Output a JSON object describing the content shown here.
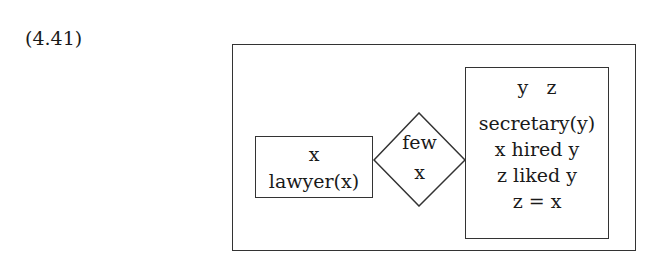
{
  "example_number": "(4.41)",
  "drs": {
    "antecedent": {
      "referents": [
        "x"
      ],
      "conditions": [
        "lawyer(x)"
      ]
    },
    "quantifier": {
      "determiner": "few",
      "variable": "x"
    },
    "consequent": {
      "referents": [
        "y",
        "z"
      ],
      "conditions": [
        "secretary(y)",
        "x hired y",
        "z liked y",
        "z = x"
      ]
    }
  }
}
